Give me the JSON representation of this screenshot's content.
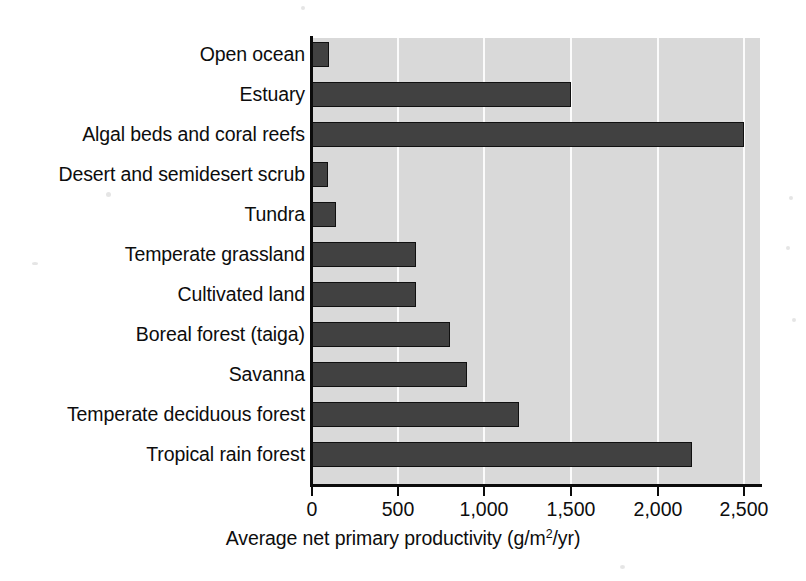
{
  "chart_data": {
    "type": "bar",
    "orientation": "horizontal",
    "title": "",
    "xlabel": "Average net primary productivity (g/m2/yr)",
    "xlabel_display": "Average net primary productivity (g/m",
    "xlabel_superscript": "2",
    "xlabel_tail": "/yr)",
    "ylabel": "",
    "categories": [
      "Open ocean",
      "Estuary",
      "Algal beds and coral reefs",
      "Desert and semidesert scrub",
      "Tundra",
      "Temperate grassland",
      "Cultivated land",
      "Boreal forest (taiga)",
      "Savanna",
      "Temperate deciduous forest",
      "Tropical rain forest"
    ],
    "values": [
      100,
      1500,
      2500,
      90,
      140,
      600,
      600,
      800,
      900,
      1200,
      2200
    ],
    "xlim": [
      0,
      2600
    ],
    "xticks": [
      0,
      500,
      1000,
      1500,
      2000,
      2500
    ],
    "xtick_labels": [
      "0",
      "500",
      "1,000",
      "1,500",
      "2,000",
      "2,500"
    ],
    "grid": "vertical-white",
    "legend": "none",
    "colors": {
      "bar_fill": "#414141",
      "bar_stroke": "#101010",
      "plot_background": "#d9d9d9",
      "gridline": "#fbfbfb",
      "axis": "#0b0b0b",
      "text": "#0d0d0d",
      "page_background": "#ffffff"
    }
  }
}
